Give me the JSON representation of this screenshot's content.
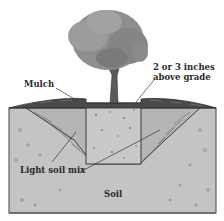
{
  "diagram": {
    "labels": {
      "mulch": "Mulch",
      "above_grade_line1": "2 or 3 inches",
      "above_grade_line2": "above grade",
      "light_soil_mix": "Light soil mix",
      "soil": "Soil"
    },
    "colors": {
      "background": "#ffffff",
      "soil": "#c4c4c4",
      "soil_mix": "#b8b8b8",
      "root_ball": "#c8c8c8",
      "mulch": "#4a4a4a",
      "canopy": "#8a8a8a",
      "trunk": "#5a5a5a",
      "outline": "#3a3a3a",
      "text": "#2a2a2a"
    }
  }
}
